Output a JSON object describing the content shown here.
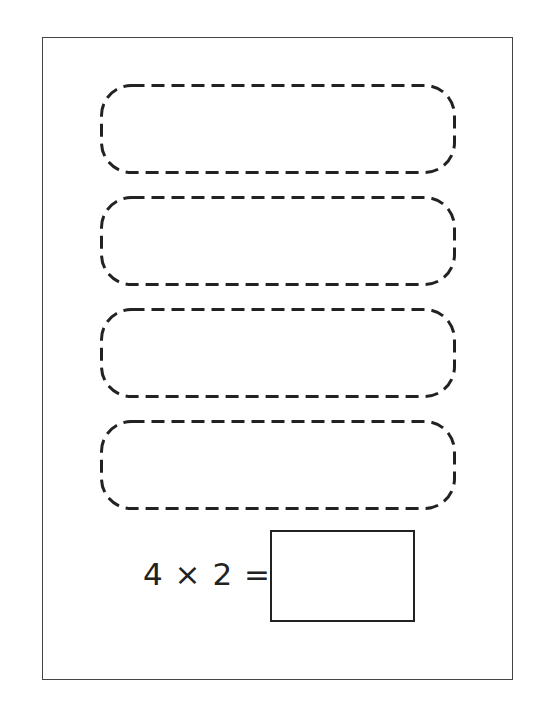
{
  "worksheet": {
    "group_box_count": 4,
    "equation": {
      "text": "4 × 2 =",
      "left_operand": "4",
      "operator": "×",
      "right_operand": "2",
      "equals": "="
    },
    "answer_box_value": "",
    "colors": {
      "line": "#222222",
      "background": "#ffffff"
    }
  }
}
